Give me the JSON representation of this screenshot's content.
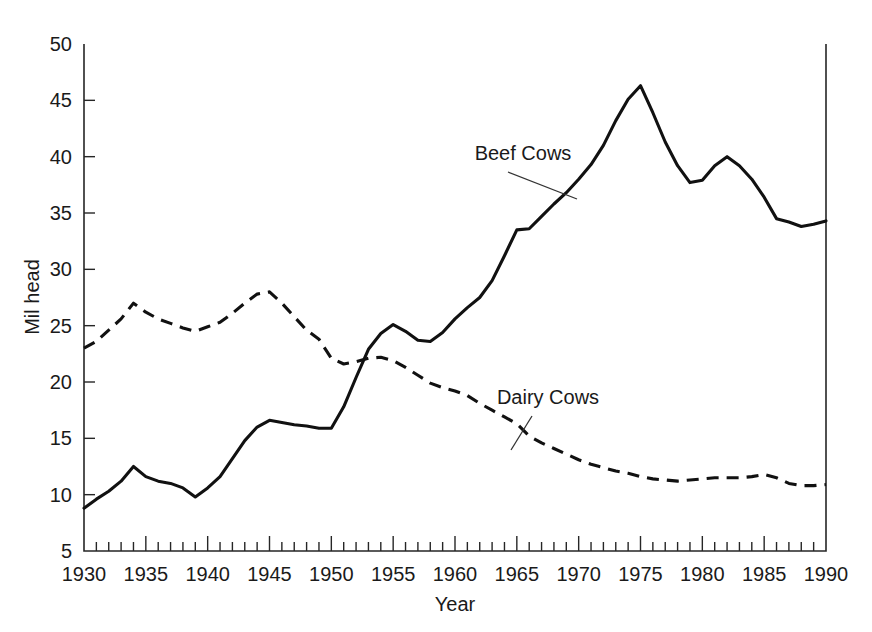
{
  "chart_data": {
    "type": "line",
    "title": "",
    "xlabel": "Year",
    "ylabel": "Mil head",
    "xlim": [
      1930,
      1990
    ],
    "ylim": [
      5,
      50
    ],
    "grid": false,
    "legend_position": "inline-annotations",
    "x_tick_labels": [
      "1930",
      "1935",
      "1940",
      "1945",
      "1950",
      "1955",
      "1960",
      "1965",
      "1970",
      "1975",
      "1980",
      "1985",
      "1990"
    ],
    "x_tick_values": [
      1930,
      1935,
      1940,
      1945,
      1950,
      1955,
      1960,
      1965,
      1970,
      1975,
      1980,
      1985,
      1990
    ],
    "x_minor_tick_interval": 1,
    "y_tick_labels": [
      "5",
      "10",
      "15",
      "20",
      "25",
      "30",
      "35",
      "40",
      "45",
      "50"
    ],
    "y_tick_values": [
      5,
      10,
      15,
      20,
      25,
      30,
      35,
      40,
      45,
      50
    ],
    "x": [
      1930,
      1931,
      1932,
      1933,
      1934,
      1935,
      1936,
      1937,
      1938,
      1939,
      1940,
      1941,
      1942,
      1943,
      1944,
      1945,
      1946,
      1947,
      1948,
      1949,
      1950,
      1951,
      1952,
      1953,
      1954,
      1955,
      1956,
      1957,
      1958,
      1959,
      1960,
      1961,
      1962,
      1963,
      1964,
      1965,
      1966,
      1967,
      1968,
      1969,
      1970,
      1971,
      1972,
      1973,
      1974,
      1975,
      1976,
      1977,
      1978,
      1979,
      1980,
      1981,
      1982,
      1983,
      1984,
      1985,
      1986,
      1987,
      1988,
      1989,
      1990
    ],
    "series": [
      {
        "name": "Beef Cows",
        "style": "solid",
        "annotation": "Beef Cows",
        "values": [
          8.8,
          9.6,
          10.3,
          11.2,
          12.5,
          11.6,
          11.2,
          11.0,
          10.6,
          9.8,
          10.6,
          11.6,
          13.2,
          14.8,
          16.0,
          16.6,
          16.4,
          16.2,
          16.1,
          15.9,
          15.9,
          17.8,
          20.4,
          22.9,
          24.3,
          25.1,
          24.5,
          23.7,
          23.6,
          24.4,
          25.6,
          26.6,
          27.5,
          29.0,
          31.2,
          33.5,
          33.6,
          34.7,
          35.8,
          36.8,
          38.0,
          39.3,
          41.0,
          43.2,
          45.1,
          46.3,
          43.9,
          41.3,
          39.2,
          37.7,
          37.9,
          39.2,
          40.0,
          39.2,
          38.0,
          36.4,
          34.5,
          34.2,
          33.8,
          34.0,
          34.3
        ]
      },
      {
        "name": "Dairy Cows",
        "style": "dashed",
        "annotation": "Dairy Cows",
        "values": [
          23.0,
          23.6,
          24.6,
          25.6,
          27.0,
          26.2,
          25.6,
          25.2,
          24.8,
          24.5,
          24.9,
          25.3,
          26.1,
          27.0,
          27.8,
          28.0,
          27.0,
          25.8,
          24.6,
          23.8,
          22.1,
          21.6,
          21.8,
          22.1,
          22.2,
          21.9,
          21.3,
          20.6,
          19.9,
          19.5,
          19.2,
          18.8,
          18.1,
          17.5,
          16.9,
          16.3,
          15.2,
          14.6,
          14.1,
          13.6,
          13.1,
          12.7,
          12.4,
          12.1,
          11.9,
          11.6,
          11.4,
          11.3,
          11.2,
          11.3,
          11.4,
          11.5,
          11.5,
          11.5,
          11.6,
          11.8,
          11.5,
          11.0,
          10.8,
          10.8,
          10.9
        ]
      }
    ]
  },
  "annotations": {
    "beef": {
      "label": "Beef Cows",
      "label_x": 523,
      "label_y": 160,
      "leader_x1": 508,
      "leader_y1": 172,
      "leader_x2": 577,
      "leader_y2": 199
    },
    "dairy": {
      "label": "Dairy Cows",
      "label_x": 548,
      "label_y": 404,
      "leader_x1": 532,
      "leader_y1": 416,
      "leader_x2": 511,
      "leader_y2": 450
    }
  },
  "colors": {
    "background": "#ffffff",
    "axis": "#262626",
    "series": "#111111",
    "text": "#1a1a1a"
  }
}
